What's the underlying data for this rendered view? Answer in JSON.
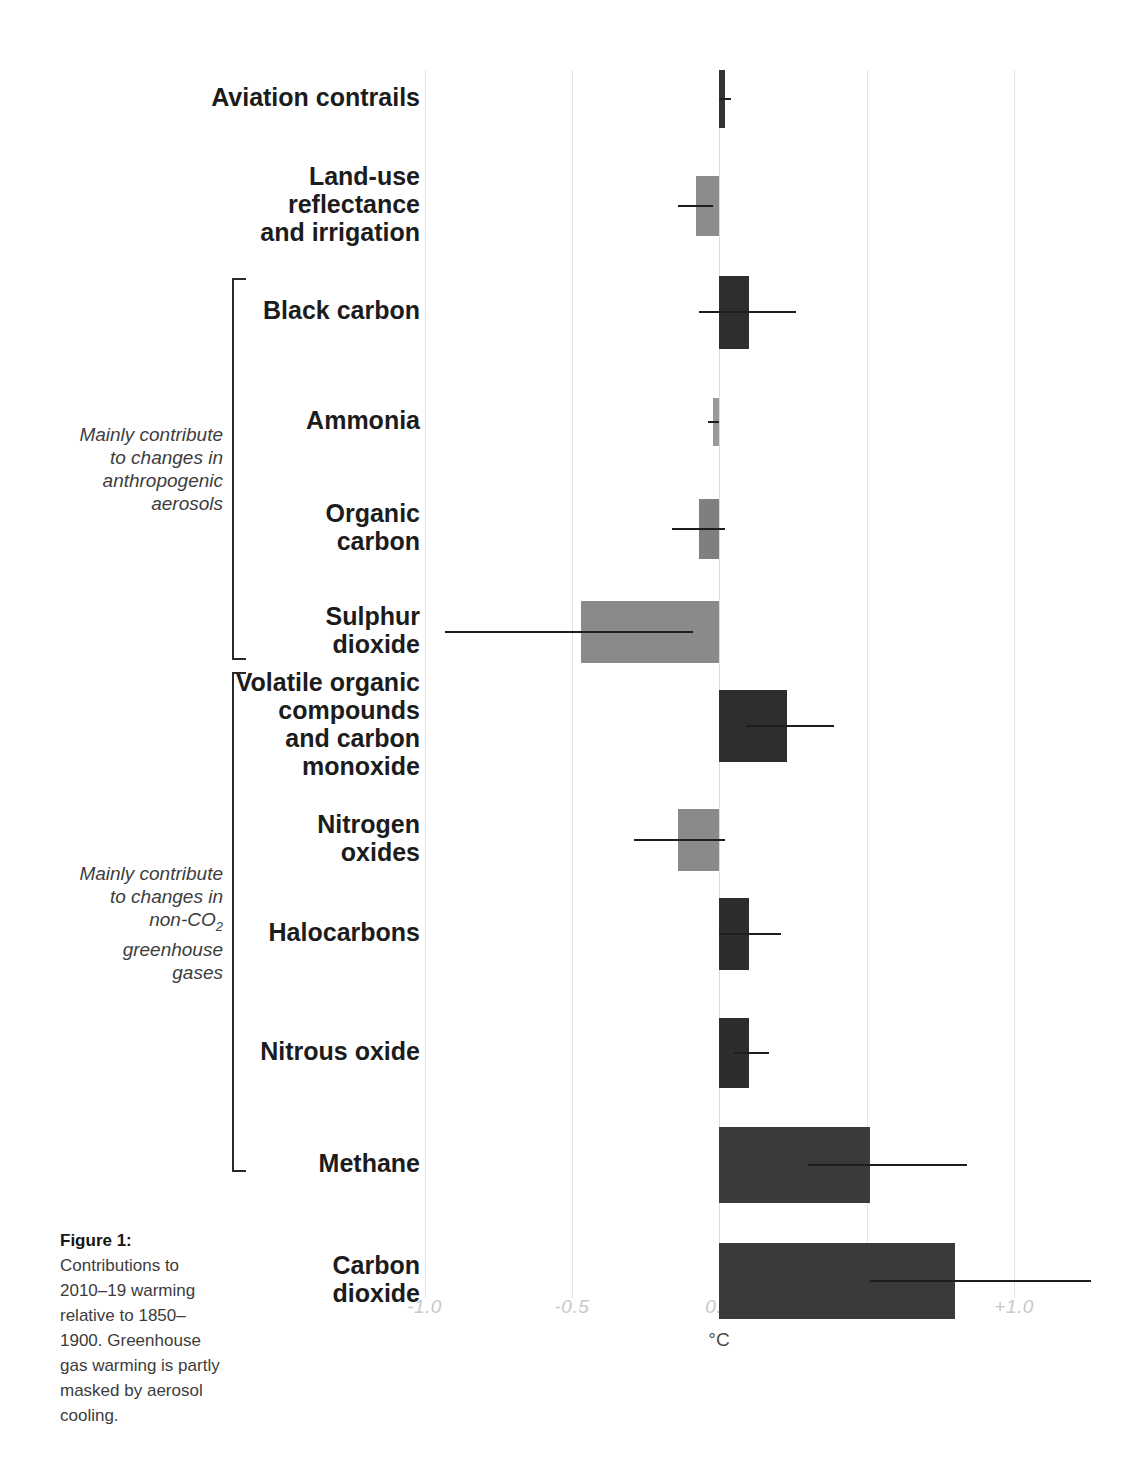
{
  "figure": {
    "caption_title": "Figure 1:",
    "caption_body": "Contributions to 2010–19 warming relative to 1850–1900. Greenhouse gas warming is partly masked by aerosol cooling."
  },
  "groups": [
    {
      "id": "aerosols",
      "caption_lines": [
        "Mainly contribute",
        "to changes in",
        "anthropogenic",
        "aerosols"
      ]
    },
    {
      "id": "non-co2-ghg",
      "caption_lines": [
        "Mainly contribute",
        "to changes in",
        "non-CO",
        "greenhouse",
        "gases"
      ],
      "caption_sub": "2"
    }
  ],
  "chart_data": {
    "type": "bar",
    "orientation": "horizontal",
    "title": "",
    "xlabel": "°C",
    "ylabel": "",
    "xlim": [
      -1.25,
      1.3
    ],
    "grid": true,
    "legend": "none",
    "xticks": [
      -1.0,
      -0.5,
      0.0,
      0.5,
      1.0
    ],
    "xtick_labels": [
      "-1.0",
      "-0.5",
      "0.0",
      "+0.5",
      "+1.0"
    ],
    "categories": [
      "Aviation contrails",
      "Land-use reflectance and irrigation",
      "Black carbon",
      "Ammonia",
      "Organic carbon",
      "Sulphur dioxide",
      "Volatile organic compounds and carbon monoxide",
      "Nitrogen oxides",
      "Halocarbons",
      "Nitrous oxide",
      "Methane",
      "Carbon dioxide"
    ],
    "values": [
      0.02,
      -0.08,
      0.1,
      -0.02,
      -0.07,
      -0.47,
      0.23,
      -0.14,
      0.1,
      0.1,
      0.51,
      0.8
    ],
    "error_low": [
      0.0,
      -0.14,
      -0.07,
      -0.04,
      -0.16,
      -0.93,
      0.09,
      -0.29,
      0.0,
      0.05,
      0.3,
      0.51
    ],
    "error_high": [
      0.04,
      -0.02,
      0.26,
      0.0,
      0.02,
      -0.09,
      0.39,
      0.02,
      0.21,
      0.17,
      0.84,
      1.26
    ],
    "bar_colors": [
      "#333333",
      "#8c8c8c",
      "#2e2e2e",
      "#9a9a9a",
      "#7f7f7f",
      "#8a8a8a",
      "#2e2e2e",
      "#8a8a8a",
      "#2d2d2d",
      "#2d2d2d",
      "#3a3a3a",
      "#3a3a3a"
    ],
    "colors": {
      "warming_bar": "#2e2e2e",
      "cooling_bar": "#8a8a8a",
      "error_bar": "#1e1e1e",
      "gridline": "#e3e3e3",
      "tick_label": "#c9c9c9"
    }
  },
  "rows": [
    {
      "label_lines": [
        "Aviation contrails"
      ],
      "name": "aviation-contrails"
    },
    {
      "label_lines": [
        "Land-use",
        "reflectance",
        "and irrigation"
      ],
      "name": "land-use-reflectance-and-irrigation"
    },
    {
      "label_lines": [
        "Black carbon"
      ],
      "name": "black-carbon"
    },
    {
      "label_lines": [
        "Ammonia"
      ],
      "name": "ammonia"
    },
    {
      "label_lines": [
        "Organic",
        "carbon"
      ],
      "name": "organic-carbon"
    },
    {
      "label_lines": [
        "Sulphur",
        "dioxide"
      ],
      "name": "sulphur-dioxide"
    },
    {
      "label_lines": [
        "Volatile organic",
        "compounds",
        "and carbon",
        "monoxide"
      ],
      "name": "volatile-organic-compounds-and-carbon-monoxide"
    },
    {
      "label_lines": [
        "Nitrogen",
        "oxides"
      ],
      "name": "nitrogen-oxides"
    },
    {
      "label_lines": [
        "Halocarbons"
      ],
      "name": "halocarbons"
    },
    {
      "label_lines": [
        "Nitrous oxide"
      ],
      "name": "nitrous-oxide"
    },
    {
      "label_lines": [
        "Methane"
      ],
      "name": "methane"
    },
    {
      "label_lines": [
        "Carbon",
        "dioxide"
      ],
      "name": "carbon-dioxide"
    }
  ]
}
